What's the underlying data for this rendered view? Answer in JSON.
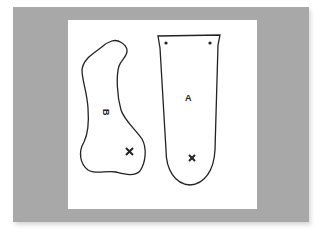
{
  "figure": {
    "background_color": "#a8a8a8",
    "paper_color": "#ffffff",
    "line_color": "#222222",
    "shapes": [
      {
        "id": "B",
        "label": "B",
        "description": "irregular blob-shaped piece",
        "mark": "x"
      },
      {
        "id": "A",
        "label": "A",
        "description": "tapered strap-shaped piece with two holes and rounded bottom",
        "mark": "x"
      }
    ]
  }
}
